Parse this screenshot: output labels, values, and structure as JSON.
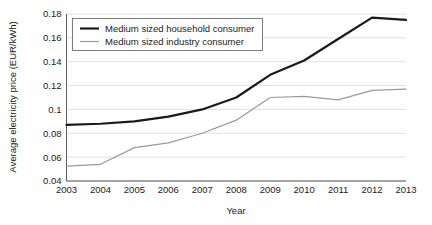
{
  "chart_data": {
    "type": "line",
    "title": "",
    "xlabel": "Year",
    "ylabel": "Average electricity price (EUR/kWh)",
    "categories": [
      "2003",
      "2004",
      "2005",
      "2006",
      "2007",
      "2008",
      "2009",
      "2010",
      "2011",
      "2012",
      "2013"
    ],
    "x": [
      2003,
      2004,
      2005,
      2006,
      2007,
      2008,
      2009,
      2010,
      2011,
      2012,
      2013
    ],
    "xlim": [
      2003,
      2013
    ],
    "ylim": [
      0.04,
      0.18
    ],
    "ytick_labels": [
      "0.04",
      "0.06",
      "0.08",
      "0.1",
      "0.12",
      "0.14",
      "0.16",
      "0.18"
    ],
    "ytick_values": [
      0.04,
      0.06,
      0.08,
      0.1,
      0.12,
      0.14,
      0.16,
      0.18
    ],
    "grid": true,
    "legend_position": "upper left",
    "series": [
      {
        "name": "Medium sized household consumer",
        "color": "#1a1a1a",
        "width": 2.2,
        "values": [
          0.087,
          0.088,
          0.09,
          0.094,
          0.1,
          0.11,
          0.129,
          0.141,
          0.159,
          0.177,
          0.175
        ]
      },
      {
        "name": "Medium sized industry consumer",
        "color": "#9a9a9a",
        "width": 1.2,
        "values": [
          0.0525,
          0.054,
          0.068,
          0.072,
          0.08,
          0.091,
          0.11,
          0.111,
          0.108,
          0.116,
          0.117
        ]
      }
    ]
  },
  "legend": {
    "items": [
      {
        "label": "Medium sized household consumer"
      },
      {
        "label": "Medium sized industry consumer"
      }
    ]
  },
  "axes": {
    "x_title": "Year",
    "y_title": "Average electricity price (EUR/kWh)"
  }
}
